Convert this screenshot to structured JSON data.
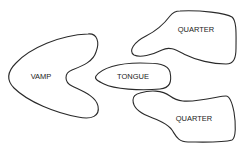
{
  "diagram": {
    "pieces": [
      {
        "id": "vamp",
        "label": "VAMP"
      },
      {
        "id": "tongue",
        "label": "TONGUE"
      },
      {
        "id": "quarter-top",
        "label": "QUARTER"
      },
      {
        "id": "quarter-bottom",
        "label": "QUARTER"
      }
    ],
    "colors": {
      "stroke": "#2a2a2a",
      "text": "#222222",
      "background": "#ffffff"
    }
  }
}
